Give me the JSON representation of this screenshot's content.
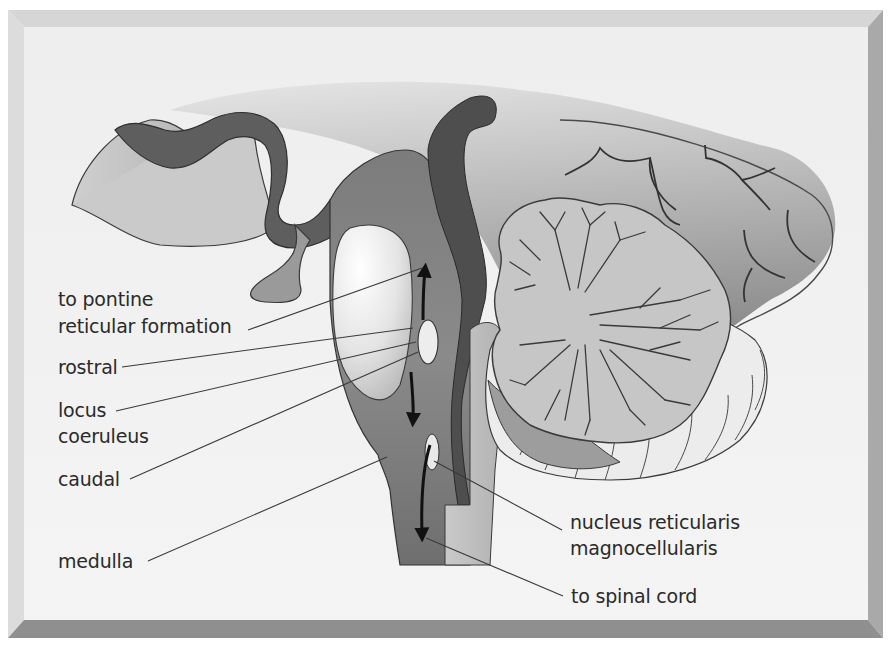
{
  "diagram": {
    "type": "anatomical-sagittal-brainstem",
    "colors": {
      "background": "#f2f2f2",
      "frame_light": "#d8d8d8",
      "frame_mid": "#bdbdbd",
      "frame_dark": "#9a9a9a",
      "brainstem_dark": "#6e6e6e",
      "brainstem_mid": "#8a8a8a",
      "cerebellum": "#c4c4c4",
      "cerebellum_white": "#efefef",
      "outline": "#3a3a3a",
      "label_text": "#2a2a2a"
    },
    "labels": {
      "pontine_line1": "to pontine",
      "pontine_line2": "reticular formation",
      "rostral": "rostral",
      "locus_line1": "locus",
      "locus_line2": "coeruleus",
      "caudal": "caudal",
      "medulla": "medulla",
      "nucleus_line1": "nucleus reticularis",
      "nucleus_line2": "magnocellularis",
      "spinal": "to spinal cord"
    },
    "arrows": [
      {
        "name": "ascending-to-pons",
        "direction": "up"
      },
      {
        "name": "descending-from-lc",
        "direction": "down"
      },
      {
        "name": "descending-to-spinal-cord",
        "direction": "down"
      }
    ]
  }
}
